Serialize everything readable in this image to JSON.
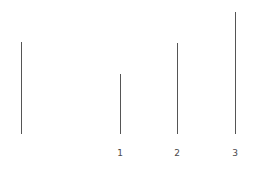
{
  "chart_data": {
    "type": "bar",
    "title": "",
    "subtitle": "",
    "xlabel": "",
    "ylabel": "",
    "grid": false,
    "legend": null,
    "orientation": "vertical",
    "baseline_y": 134,
    "categories": [
      "",
      "1",
      "2",
      "3"
    ],
    "tick_labels": [
      "1",
      "2",
      "3"
    ],
    "values": [
      92,
      60,
      91,
      122
    ],
    "xlim": [
      0,
      255
    ],
    "ylim": [
      0,
      173
    ],
    "series": [
      {
        "name": "stems",
        "values": [
          92,
          60,
          91,
          122
        ]
      }
    ],
    "points": [
      {
        "index": 0,
        "label": "",
        "x": 21,
        "top": 42,
        "height": 92,
        "color": "#555555"
      },
      {
        "index": 1,
        "label": "1",
        "x": 120,
        "top": 74,
        "height": 60,
        "color": "#555555"
      },
      {
        "index": 2,
        "label": "2",
        "x": 177,
        "top": 43,
        "height": 91,
        "color": "#555555"
      },
      {
        "index": 3,
        "label": "3",
        "x": 235,
        "top": 12,
        "height": 122,
        "color": "#555555"
      }
    ],
    "colors": {
      "background": "#ffffff",
      "stroke": "#555555",
      "tick_label": "#4a4a4a"
    }
  }
}
